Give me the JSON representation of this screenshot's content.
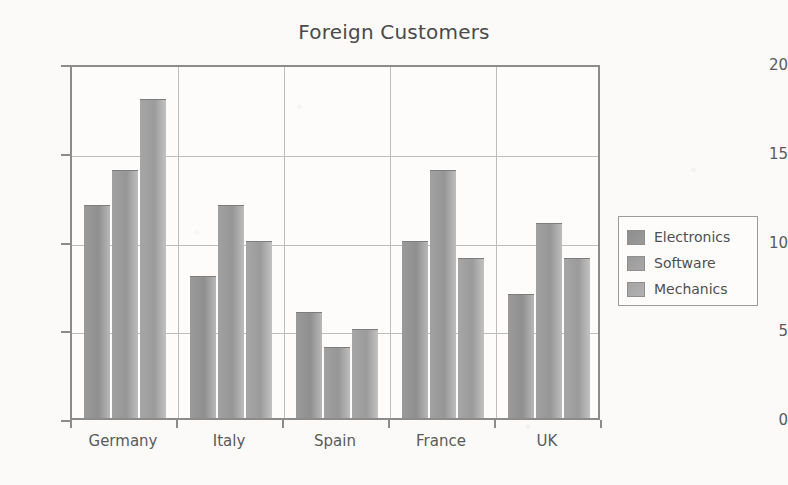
{
  "chart_data": {
    "type": "bar",
    "title": "Foreign Customers",
    "xlabel": "",
    "ylabel": "",
    "categories": [
      "Germany",
      "Italy",
      "Spain",
      "France",
      "UK"
    ],
    "series": [
      {
        "name": "Electronics",
        "values": [
          12,
          8,
          6,
          10,
          7
        ],
        "color": "#929292"
      },
      {
        "name": "Software",
        "values": [
          14,
          12,
          4,
          14,
          11
        ],
        "color": "#9c9c9c"
      },
      {
        "name": "Mechanics",
        "values": [
          18,
          10,
          5,
          9,
          9
        ],
        "color": "#a6a6a6"
      }
    ],
    "ylim": [
      0,
      20
    ],
    "yticks": [
      0,
      5,
      10,
      15,
      20
    ],
    "ytick_labels": [
      "0",
      "5",
      "10",
      "15",
      "20"
    ],
    "grid": true,
    "legend_position": "right"
  },
  "legend": {
    "items": [
      {
        "label": "Electronics"
      },
      {
        "label": "Software"
      },
      {
        "label": "Mechanics"
      }
    ]
  },
  "axis": {
    "y_labels": [
      "20",
      "15",
      "10",
      "5",
      "0"
    ],
    "x_labels": [
      "Germany",
      "Italy",
      "Spain",
      "France",
      "UK"
    ]
  }
}
